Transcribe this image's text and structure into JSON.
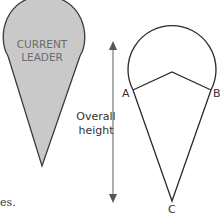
{
  "diagram": {
    "left_shape": {
      "label_line1": "CURRENT",
      "label_line2": "LEADER",
      "fill": "#c9c9c9",
      "stroke": "#3a3a3a"
    },
    "dimension": {
      "label_line1": "Overall",
      "label_line2": "height",
      "color": "#666666"
    },
    "right_shape": {
      "point_a": "A",
      "point_b": "B",
      "point_c": "C",
      "stroke": "#2a2a2a"
    },
    "text_fragment": "es."
  }
}
